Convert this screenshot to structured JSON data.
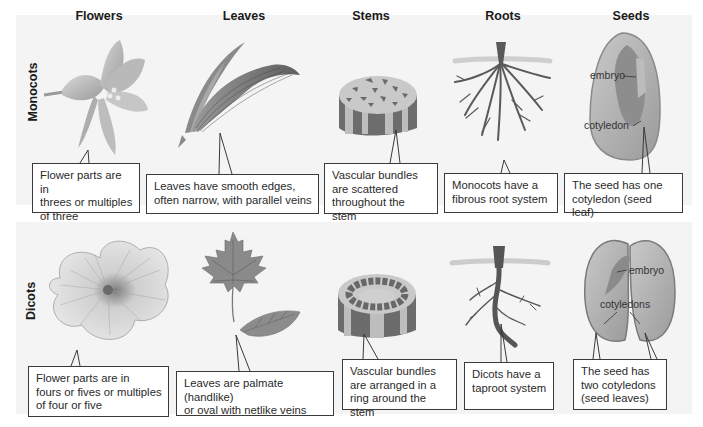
{
  "figure": {
    "columns": [
      "Flowers",
      "Leaves",
      "Stems",
      "Roots",
      "Seeds"
    ],
    "rows": [
      {
        "label": "Monocots",
        "callouts": {
          "flowers": "Flower parts are in\nthrees or multiples\nof three",
          "leaves": "Leaves have smooth edges,\noften narrow, with parallel veins",
          "stems": "Vascular bundles\nare scattered\nthroughout the stem",
          "roots": "Monocots have a\nfibrous root system",
          "seeds": "The seed has one\ncotyledon (seed leaf)"
        },
        "seed_labels": {
          "embryo": "embryo",
          "cotyledon": "cotyledon"
        }
      },
      {
        "label": "Dicots",
        "callouts": {
          "flowers": "Flower parts are in\nfours or fives or multiples\nof four or five",
          "leaves": "Leaves are palmate (handlike)\nor oval with netlike veins",
          "stems": "Vascular bundles\nare arranged in a\nring around the stem",
          "roots": "Dicots have a\ntaproot system",
          "seeds": "The seed has\ntwo cotyledons\n(seed leaves)"
        },
        "seed_labels": {
          "embryo": "embryo",
          "cotyledon": "cotyledons"
        }
      }
    ],
    "icons": {
      "monocot_flower": "lily-flower-icon",
      "monocot_leaf": "parallel-vein-leaf-icon",
      "monocot_stem": "scattered-bundle-stem-icon",
      "monocot_root": "fibrous-root-icon",
      "monocot_seed": "one-cotyledon-seed-icon",
      "dicot_flower": "five-petal-flower-icon",
      "dicot_leaf": "maple-and-oval-leaf-icon",
      "dicot_stem": "ring-bundle-stem-icon",
      "dicot_root": "taproot-icon",
      "dicot_seed": "two-cotyledon-seed-icon"
    },
    "colors": {
      "band": "#f4f4f4",
      "box_border": "#3a3a3a",
      "illustration_dark": "#5a5a5a",
      "illustration_mid": "#8c8c8c",
      "illustration_light": "#c4c4c4"
    }
  }
}
